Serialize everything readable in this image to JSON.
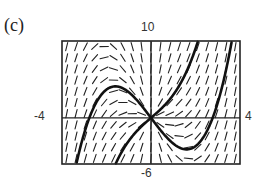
{
  "figure": {
    "panel_label": "(c)"
  },
  "chart_data": {
    "type": "line",
    "title": "",
    "subtitle": "Slope field with two solution curves through the origin",
    "xlabel": "",
    "ylabel": "",
    "xlim": [
      -4,
      4
    ],
    "ylim": [
      -6,
      10
    ],
    "tick_labels": {
      "top": "10",
      "bottom": "-6",
      "left": "-4",
      "right": "4"
    },
    "grid": false,
    "legend": null,
    "slope_field": {
      "equation": "dy/dx = y/x + x^2",
      "grid_cols": 19,
      "grid_rows": 11
    },
    "series": [
      {
        "name": "solution-curve-1",
        "formula": "y = x^3/2 - 3.84x",
        "x": [
          -3.3,
          -2.77,
          -2.0,
          -1.6,
          -1.0,
          0.0,
          1.0,
          1.6,
          2.0,
          2.77,
          3.2,
          3.55
        ],
        "y": [
          -5.3,
          0.0,
          3.7,
          4.1,
          3.3,
          0.0,
          -3.3,
          -4.1,
          -3.7,
          0.0,
          4.1,
          8.8
        ]
      },
      {
        "name": "solution-curve-2",
        "formula": "y = x^3/2 + 2.5x",
        "x": [
          -1.4,
          -1.0,
          0.0,
          1.0,
          1.5,
          2.07
        ],
        "y": [
          -4.9,
          -3.0,
          0.0,
          3.0,
          5.4,
          9.6
        ]
      }
    ],
    "colors": {
      "curve": "#111111",
      "field": "#222222",
      "axes": "#222222",
      "frame": "#222222"
    }
  }
}
